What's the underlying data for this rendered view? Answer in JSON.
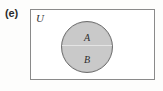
{
  "figure": {
    "part_label": "(e)",
    "universe_label": "U",
    "sets": [
      {
        "id": "A",
        "label": "A",
        "position": "upper-half-of-circle"
      },
      {
        "id": "B",
        "label": "B",
        "position": "lower-half-of-circle"
      }
    ],
    "relationship": "A and B occupy the same shaded circle, split by a horizontal divider, inside the universal set U",
    "colors": {
      "page_background": "#fdfdfc",
      "rect_border": "#8a8a8a",
      "rect_fill": "#ffffff",
      "circle_fill": "#c9c9c9",
      "circle_border": "#6f6f6f",
      "divider": "#e4e4e4",
      "text": "#2e2e2e",
      "part_label_text": "#2b2b2b"
    }
  }
}
